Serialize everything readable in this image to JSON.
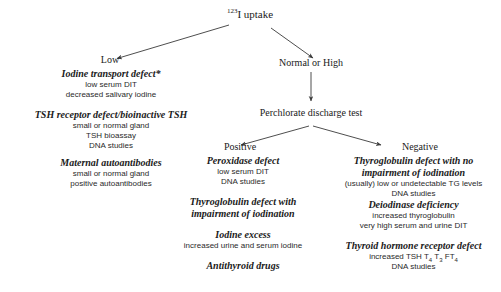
{
  "diagram": {
    "title": {
      "isotope": "123",
      "element": "I uptake"
    },
    "branches": {
      "low": "Low",
      "normal_high": "Normal or High",
      "test": "Perchlorate discharge test",
      "positive": "Positive",
      "negative": "Negative"
    },
    "low_column": [
      {
        "name": "Iodine transport defect*",
        "details": [
          "low serum DIT",
          "decreased salivary iodine"
        ]
      },
      {
        "name": "TSH receptor defect/bioinactive TSH",
        "details": [
          "small or normal gland",
          "TSH bioassay",
          "DNA studies"
        ]
      },
      {
        "name": "Maternal autoantibodies",
        "details": [
          "small or normal gland",
          "positive autoantibodies"
        ]
      }
    ],
    "positive_column": [
      {
        "name": "Peroxidase defect",
        "details": [
          "low serum DIT",
          "DNA studies"
        ]
      },
      {
        "name_line1": "Thyroglobulin defect with",
        "name_line2": "impairment of  iodination",
        "details": []
      },
      {
        "name": "Iodine excess",
        "details": [
          "increased urine and serum iodine"
        ]
      },
      {
        "name": "Antithyroid drugs",
        "details": []
      }
    ],
    "negative_column": [
      {
        "name_line1": "Thyroglobulin defect with no",
        "name_line2": "impairment of iodination",
        "details": [
          "(usually) low or undetectable TG levels",
          "DNA studies"
        ]
      },
      {
        "name": "Deiodinase deficiency",
        "details": [
          "increased thyroglobulin",
          "very high serum and urine DIT"
        ]
      },
      {
        "name": "Thyroid hormone receptor defect",
        "details_rich": [
          "increased TSH T<sub>4</sub> T<sub>3</sub> FT<sub>4</sub>",
          "DNA studies"
        ]
      }
    ],
    "colors": {
      "background": "#ffffff",
      "text": "#1a1a1a",
      "arrow": "#3a3a3a"
    }
  }
}
